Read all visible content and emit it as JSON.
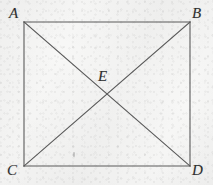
{
  "figure": {
    "kind": "geometry-diagram",
    "background_color": "#f7f7f6",
    "stroke_color": "#5a5a5a",
    "label_color": "#2e2e2e",
    "stroke_width": 1.1,
    "canvas": {
      "width": 213,
      "height": 185
    },
    "vertices": [
      {
        "id": "A",
        "label": "A",
        "x": 24,
        "y": 22,
        "role": "top-left"
      },
      {
        "id": "B",
        "label": "B",
        "x": 190,
        "y": 22,
        "role": "top-right"
      },
      {
        "id": "C",
        "label": "C",
        "x": 24,
        "y": 166,
        "role": "bottom-left"
      },
      {
        "id": "D",
        "label": "D",
        "x": 190,
        "y": 166,
        "role": "bottom-right"
      }
    ],
    "interior_points": [
      {
        "id": "E",
        "label": "E",
        "x": 107,
        "y": 94,
        "role": "diagonal-intersection"
      }
    ],
    "edges": [
      {
        "id": "AB",
        "from": "A",
        "to": "B",
        "kind": "side"
      },
      {
        "id": "BD",
        "from": "B",
        "to": "D",
        "kind": "side"
      },
      {
        "id": "DC",
        "from": "D",
        "to": "C",
        "kind": "side"
      },
      {
        "id": "CA",
        "from": "C",
        "to": "A",
        "kind": "side"
      },
      {
        "id": "AD",
        "from": "A",
        "to": "D",
        "kind": "diagonal"
      },
      {
        "id": "BC",
        "from": "B",
        "to": "C",
        "kind": "diagonal"
      }
    ],
    "marks": [
      {
        "id": "stray-speck",
        "x": 74,
        "y": 155
      }
    ]
  }
}
